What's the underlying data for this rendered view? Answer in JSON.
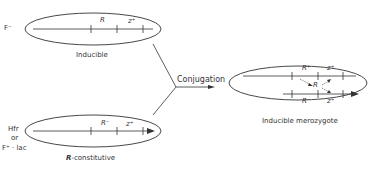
{
  "top_cell": {
    "strain_label": "F⁻",
    "gene_R": "R",
    "gene_z": "z⁺",
    "caption": "Inducible"
  },
  "bottom_cell": {
    "strain_label_1": "Hfr",
    "strain_label_2": "or",
    "strain_label_3": "F⁺ · lac",
    "gene_R": "R⁻",
    "gene_z": "z⁺",
    "caption_prefix": "R",
    "caption_suffix": "-constitutive"
  },
  "process": {
    "label": "Conjugation"
  },
  "merozygote": {
    "upper_R": "R⁺",
    "upper_z": "z⁺",
    "repressor": "R",
    "lower_R": "R⁻",
    "lower_z": "z⁺",
    "caption": "Inducible merozygote"
  },
  "colors": {
    "line": "#333333"
  }
}
